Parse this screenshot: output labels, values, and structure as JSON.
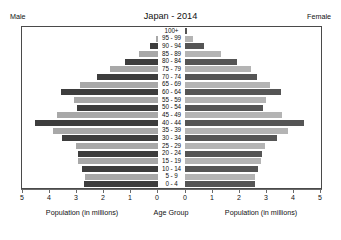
{
  "header": {
    "title": "Japan - 2014",
    "male_label": "Male",
    "female_label": "Female"
  },
  "axis": {
    "left_caption": "Population (in millions)",
    "center_caption": "Age Group",
    "right_caption": "Population (in millions)",
    "left_ticks": [
      "5",
      "4",
      "3",
      "2",
      "1",
      "0"
    ],
    "right_ticks": [
      "0",
      "1",
      "2",
      "3",
      "4",
      "5"
    ]
  },
  "chart_data": {
    "type": "bar",
    "title": "Japan - 2014",
    "subtitle": "",
    "xlabel": "Population (in millions)",
    "ylabel": "Age Group",
    "xlim": [
      0,
      5
    ],
    "grid": false,
    "legend_position": "top-corners",
    "categories": [
      "100+",
      "95 - 99",
      "90 - 94",
      "85 - 89",
      "80 - 84",
      "75 - 79",
      "70 - 74",
      "65 - 69",
      "60 - 64",
      "55 - 59",
      "50 - 54",
      "45 - 49",
      "40 - 44",
      "35 - 39",
      "30 - 34",
      "25 - 29",
      "20 - 24",
      "15 - 19",
      "10 - 14",
      "5 - 9",
      "0 - 4"
    ],
    "series": [
      {
        "name": "Male",
        "values": [
          0.01,
          0.08,
          0.3,
          0.72,
          1.22,
          1.78,
          2.25,
          2.9,
          3.6,
          3.1,
          3.0,
          3.75,
          4.55,
          3.9,
          3.55,
          3.05,
          2.95,
          2.95,
          2.8,
          2.7,
          2.75
        ]
      },
      {
        "name": "Female",
        "values": [
          0.06,
          0.28,
          0.7,
          1.35,
          1.92,
          2.45,
          2.65,
          3.15,
          3.55,
          3.0,
          2.9,
          3.6,
          4.4,
          3.8,
          3.4,
          2.95,
          2.85,
          2.8,
          2.7,
          2.6,
          2.6
        ]
      }
    ]
  },
  "scale": {
    "px_per_unit": 27,
    "bar_colors": {
      "male_dark": "#3d3d3d",
      "male_light": "#a8a8a8",
      "female_dark": "#555555",
      "female_light": "#b4b4b4"
    }
  }
}
